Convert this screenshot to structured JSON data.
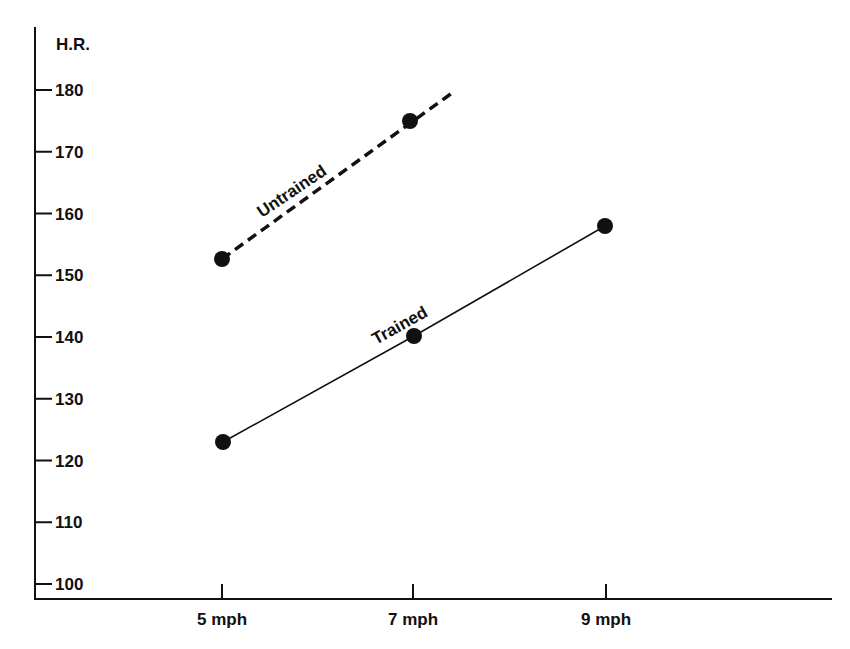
{
  "chart_data": {
    "type": "line",
    "title": "",
    "xlabel": "",
    "ylabel": "H.R.",
    "categories": [
      "5 mph",
      "7 mph",
      "9 mph"
    ],
    "x_values": [
      5,
      7,
      9
    ],
    "ylim": [
      100,
      180
    ],
    "yticks": [
      100,
      110,
      120,
      130,
      140,
      150,
      160,
      170,
      180
    ],
    "grid": false,
    "legend": "inline labels on lines",
    "series": [
      {
        "name": "Untrained",
        "style": "dashed",
        "values": [
          153,
          175,
          null
        ],
        "extends_beyond_last_point": true
      },
      {
        "name": "Trained",
        "style": "solid",
        "values": [
          123,
          140,
          158
        ]
      }
    ]
  },
  "labels": {
    "y_axis_title": "H.R.",
    "x_ticks": [
      "5 mph",
      "7 mph",
      "9 mph"
    ],
    "y_ticks": [
      "100",
      "110",
      "120",
      "130",
      "140",
      "150",
      "160",
      "170",
      "180"
    ],
    "untrained": "Untrained",
    "trained": "Trained"
  }
}
